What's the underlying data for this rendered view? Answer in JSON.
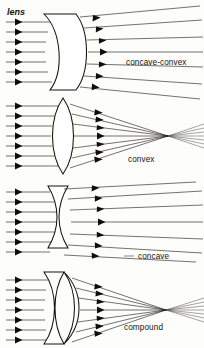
{
  "figure": {
    "title": "lens",
    "background_color": "#fdfdfc",
    "ink_color": "#15130f",
    "width": 204,
    "height": 348
  },
  "panels": [
    {
      "id": "concave-convex",
      "label": "concave-convex",
      "label_x": 126,
      "label_y": 65,
      "lens_type": "meniscus",
      "description": "concave-convex meniscus lens, slightly diverging beam",
      "ray_count": 7,
      "ray_start_x": 6,
      "ray_ys": [
        22,
        32,
        42,
        52,
        62,
        72,
        82
      ],
      "lens_left_x": 44,
      "lens_right_x": 86,
      "lens_top_y": 14,
      "lens_bottom_y": 90,
      "focal_behaviour": "diverging",
      "virtual_focus_x": -70,
      "virtual_focus_y": 52
    },
    {
      "id": "convex",
      "label": "convex",
      "label_x": 128,
      "label_y": 162,
      "lens_type": "biconvex",
      "description": "biconvex converging lens, rays meet at a focal point then diverge",
      "ray_count": 7,
      "ray_start_x": 6,
      "ray_ys": [
        106,
        116,
        126,
        136,
        146,
        156,
        166
      ],
      "lens_left_x": 50,
      "lens_right_x": 76,
      "lens_top_y": 98,
      "lens_bottom_y": 174,
      "focal_behaviour": "converging",
      "focus_x": 168,
      "focus_y": 136
    },
    {
      "id": "concave",
      "label": "concave",
      "label_x": 138,
      "label_y": 259,
      "lens_type": "biconcave",
      "description": "biconcave diverging lens, rays spread apart after the lens",
      "ray_count": 7,
      "ray_start_x": 6,
      "ray_ys": [
        192,
        202,
        212,
        222,
        232,
        242,
        252
      ],
      "lens_left_x": 48,
      "lens_right_x": 80,
      "lens_top_y": 186,
      "lens_bottom_y": 248,
      "focal_behaviour": "diverging",
      "virtual_focus_x": -55,
      "virtual_focus_y": 222,
      "has_leader_line": true,
      "leader_x1": 124,
      "leader_y1": 256,
      "leader_x2": 134,
      "leader_y2": 256
    },
    {
      "id": "compound",
      "label": "compound",
      "label_x": 124,
      "label_y": 330,
      "lens_type": "compound",
      "description": "compound doublet: meniscus element cemented to a convex element, converging",
      "ray_count": 7,
      "ray_start_x": 6,
      "ray_ys": [
        280,
        290,
        300,
        310,
        320,
        330,
        340
      ],
      "lens_left_x": 44,
      "lens_right_x": 84,
      "lens_top_y": 272,
      "lens_bottom_y": 344,
      "focal_behaviour": "converging",
      "focus_x": 166,
      "focus_y": 310
    }
  ],
  "icons": {
    "arrowhead": "solid-triangle-right"
  }
}
